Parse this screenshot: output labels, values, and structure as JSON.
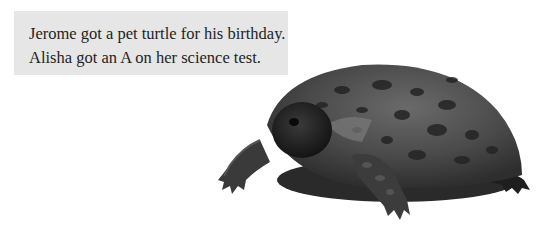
{
  "caption": {
    "lines": [
      "Jerome got a pet turtle for his birthday.",
      "Alisha got an A on her science test."
    ],
    "background": "#e6e6e6",
    "text_color": "#1e1e1e"
  },
  "image": {
    "subject": "turtle-photo",
    "description": "Photo of a tortoise/turtle with a dark spotted domed shell, walking toward the left"
  }
}
